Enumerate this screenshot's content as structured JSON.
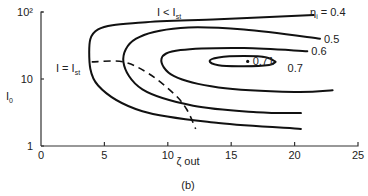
{
  "chart_data": {
    "type": "line",
    "title": "",
    "caption": "(b)",
    "xlabel": "ζ out",
    "ylabel": "I0",
    "xlim": [
      0,
      25
    ],
    "ylim": [
      1,
      100
    ],
    "yscale": "log",
    "xticks": [
      0,
      5,
      10,
      15,
      20,
      25
    ],
    "xtick_labels": [
      "0",
      "5",
      "10",
      "15",
      "20",
      "25"
    ],
    "yticks": [
      1,
      10,
      100
    ],
    "ytick_labels": [
      "1",
      "10",
      "10²"
    ],
    "grid": false,
    "contours": [
      {
        "name": "ηi = 0.4",
        "label": "ηi = 0.4",
        "level": 0.4,
        "points": [
          [
            21.5,
            90
          ],
          [
            14,
            78
          ],
          [
            8,
            70
          ],
          [
            4.5,
            55
          ],
          [
            3.8,
            25
          ],
          [
            4.5,
            8
          ],
          [
            8,
            3.3
          ],
          [
            14,
            2.2
          ],
          [
            20.5,
            1.8
          ]
        ]
      },
      {
        "name": "0.5",
        "label": "0.5",
        "level": 0.5,
        "points": [
          [
            22,
            40
          ],
          [
            16,
            55
          ],
          [
            11,
            58
          ],
          [
            7.5,
            40
          ],
          [
            6.5,
            18
          ],
          [
            8,
            7
          ],
          [
            12,
            4
          ],
          [
            17,
            3.2
          ],
          [
            20.5,
            3.1
          ]
        ]
      },
      {
        "name": "0.6",
        "label": "0.6",
        "level": 0.6,
        "points": [
          [
            21,
            26
          ],
          [
            16,
            29
          ],
          [
            11,
            27
          ],
          [
            9.5,
            20
          ],
          [
            10.5,
            11
          ],
          [
            14,
            7.5
          ],
          [
            20,
            6.4
          ],
          [
            23,
            6.8
          ]
        ]
      },
      {
        "name": "0.7",
        "label": "0.7",
        "level": 0.7,
        "points": [
          [
            18.5,
            18
          ],
          [
            17.8,
            21
          ],
          [
            16,
            22
          ],
          [
            14,
            21
          ],
          [
            13.3,
            18.5
          ],
          [
            14,
            16
          ],
          [
            16,
            15.5
          ],
          [
            18,
            16.2
          ],
          [
            18.5,
            18
          ]
        ]
      }
    ],
    "peak": {
      "label": "0.71",
      "x": 16.3,
      "y": 18.3
    },
    "boundary": {
      "label": "I = Ist",
      "style": "dashed",
      "points": [
        [
          4.0,
          18
        ],
        [
          6.5,
          18
        ],
        [
          8.5,
          12
        ],
        [
          10.5,
          6
        ],
        [
          11.5,
          3.5
        ],
        [
          12.2,
          1.8
        ]
      ]
    },
    "annotations": [
      {
        "text": "I < Ist",
        "region": "upper"
      },
      {
        "text": "I = Ist",
        "region": "left"
      }
    ]
  }
}
